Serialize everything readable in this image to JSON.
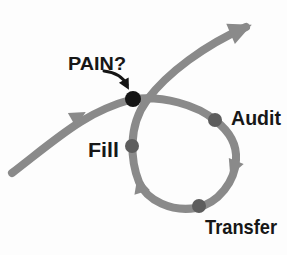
{
  "diagram": {
    "labels": {
      "pain": "PAIN?",
      "fill": "Fill",
      "audit": "Audit",
      "transfer": "Transfer"
    },
    "colors": {
      "background": "#fdfdfd",
      "flow_stroke": "#8a8a8a",
      "node_dot": "#5d5d5d",
      "pain_dot": "#151515",
      "pointer": "#151515",
      "label_text": "#171717"
    }
  }
}
